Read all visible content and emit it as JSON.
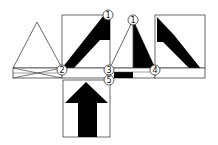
{
  "diagram": {
    "type": "net-folding-diagram",
    "labels": {
      "c1a": "1",
      "c1b": "1",
      "c2": "2",
      "c3": "3",
      "c4": "4",
      "c5": "5"
    },
    "colors": {
      "stroke": "#333333",
      "fill": "#000000",
      "background": "#ffffff"
    }
  }
}
